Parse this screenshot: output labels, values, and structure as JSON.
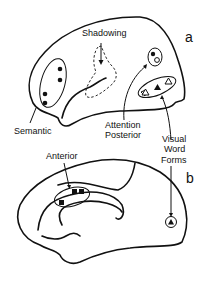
{
  "panels": [
    {
      "id": "a",
      "label": "a",
      "view": "lateral",
      "regions": [
        {
          "name": "Semantic",
          "markers": [
            "filled-circle",
            "filled-circle",
            "filled-circle",
            "filled-circle"
          ]
        },
        {
          "name": "Shadowing",
          "markers": []
        },
        {
          "name": "Attention Posterior",
          "markers": [
            "filled-circle",
            "open-circle"
          ]
        },
        {
          "name": "Visual Word Forms",
          "markers": [
            "open-triangle",
            "filled-triangle",
            "open-triangle"
          ]
        }
      ]
    },
    {
      "id": "b",
      "label": "b",
      "view": "medial",
      "regions": [
        {
          "name": "Anterior",
          "markers": [
            "filled-square",
            "filled-square",
            "filled-square"
          ]
        },
        {
          "name": "Visual Word Forms",
          "markers": [
            "filled-triangle"
          ]
        }
      ]
    }
  ],
  "labels": {
    "shadowing": "Shadowing",
    "semantic": "Semantic",
    "attention_line1": "Attention",
    "attention_line2": "Posterior",
    "visual_line1": "Visual",
    "visual_line2": "Word",
    "visual_line3": "Forms",
    "anterior": "Anterior",
    "panel_a": "a",
    "panel_b": "b"
  }
}
